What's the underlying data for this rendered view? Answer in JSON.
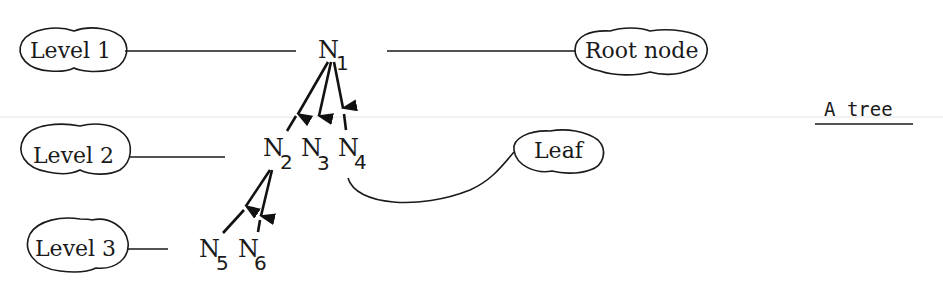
{
  "diagram": {
    "title": "A tree",
    "labels": {
      "level1": "Level 1",
      "level2": "Level 2",
      "level3": "Level 3",
      "root": "Root node",
      "leaf": "Leaf"
    },
    "nodes": [
      {
        "id": "N1",
        "letter": "N",
        "sub": "1",
        "level": 1
      },
      {
        "id": "N2",
        "letter": "N",
        "sub": "2",
        "level": 2
      },
      {
        "id": "N3",
        "letter": "N",
        "sub": "3",
        "level": 2
      },
      {
        "id": "N4",
        "letter": "N",
        "sub": "4",
        "level": 2
      },
      {
        "id": "N5",
        "letter": "N",
        "sub": "5",
        "level": 3
      },
      {
        "id": "N6",
        "letter": "N",
        "sub": "6",
        "level": 3
      }
    ],
    "edges": [
      {
        "from": "N1",
        "to": "N2"
      },
      {
        "from": "N1",
        "to": "N3"
      },
      {
        "from": "N1",
        "to": "N4"
      },
      {
        "from": "N2",
        "to": "N5"
      },
      {
        "from": "N2",
        "to": "N6"
      }
    ],
    "annotations": [
      {
        "label": "Level 1",
        "points_to": "N1"
      },
      {
        "label": "Root node",
        "points_to": "N1"
      },
      {
        "label": "Level 2",
        "points_to": "N2"
      },
      {
        "label": "Leaf",
        "points_to": "N4"
      },
      {
        "label": "Level 3",
        "points_to": "N5"
      }
    ]
  }
}
